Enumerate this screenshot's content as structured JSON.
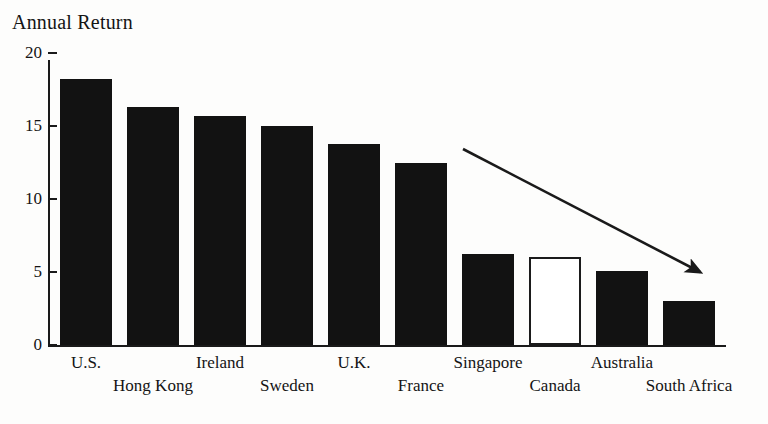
{
  "chart_data": {
    "type": "bar",
    "title": "Annual Return",
    "xlabel": "",
    "ylabel": "",
    "ylim": [
      0,
      20
    ],
    "yticks": [
      0,
      5,
      10,
      15,
      20
    ],
    "ytick_labels": [
      "0",
      "5",
      "10",
      "15",
      "20"
    ],
    "grid": false,
    "legend": "none",
    "categories": [
      "U.S.",
      "Hong Kong",
      "Ireland",
      "Sweden",
      "U.K.",
      "France",
      "Singapore",
      "Canada",
      "Australia",
      "South Africa"
    ],
    "values": [
      18.2,
      16.3,
      15.7,
      15.0,
      13.8,
      12.5,
      6.2,
      6.0,
      5.1,
      3.0
    ],
    "bar_styles": [
      "filled",
      "filled",
      "filled",
      "filled",
      "filled",
      "filled",
      "filled",
      "hollow",
      "filled",
      "filled"
    ],
    "colors": {
      "bar_fill": "#121212",
      "bar_hollow_fill": "#ffffff",
      "bar_outline": "#1b1b1b",
      "axis": "#1a1a1a",
      "text": "#141414",
      "background": "#fdfdfc",
      "arrow": "#1a1a1a"
    },
    "annotations": [
      {
        "name": "declining-trend-arrow",
        "type": "arrow",
        "from": {
          "x": 463,
          "y": 149
        },
        "to": {
          "x": 709,
          "y": 277
        },
        "description": "downward trend arrow"
      }
    ]
  },
  "labels": {
    "label_rows": [
      0,
      1,
      0,
      1,
      0,
      1,
      0,
      1,
      0,
      1
    ]
  },
  "geometry": {
    "plot_left": 48,
    "plot_baseline": 345,
    "plot_top": 60,
    "bar_width": 52,
    "bar_pitch": 67,
    "first_bar_left": 60,
    "px_per_unit": 14.6
  }
}
